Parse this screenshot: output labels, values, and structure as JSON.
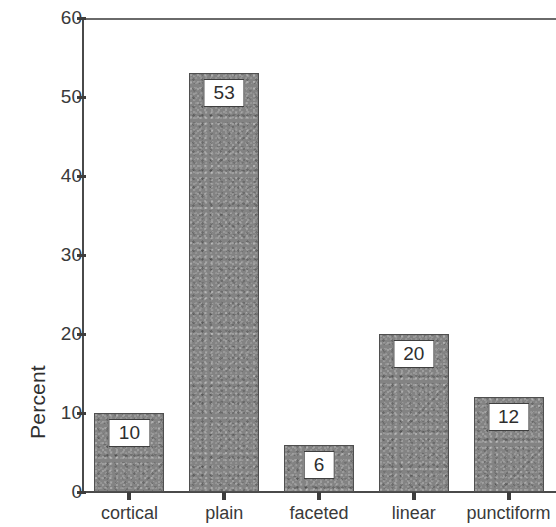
{
  "chart_data": {
    "type": "bar",
    "title": "",
    "xlabel": "",
    "ylabel": "Percent",
    "categories": [
      "cortical",
      "plain",
      "faceted",
      "linear",
      "punctiform"
    ],
    "values": [
      10,
      53,
      6,
      20,
      12
    ],
    "data_labels": [
      "10",
      "53",
      "6",
      "20",
      "12"
    ],
    "ylim": [
      0,
      60
    ],
    "ytick_labels": [
      "0",
      "10",
      "20",
      "30",
      "40",
      "50",
      "60"
    ],
    "ytick_values": [
      0,
      10,
      20,
      30,
      40,
      50,
      60
    ],
    "grid": false,
    "legend": false,
    "bar_color": "#838383",
    "bar_edge_color": "#4f4f4f",
    "axis_color": "#4a4a4a",
    "background_color": "#ffffff",
    "label_box_background": "#ffffff",
    "label_box_border": "#3f3f3f"
  }
}
